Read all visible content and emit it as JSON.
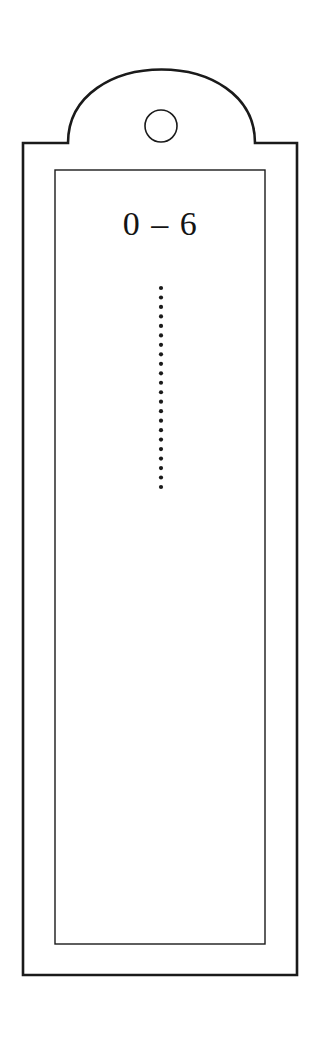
{
  "figure": {
    "name": "hang-tag-outline",
    "background_color": "#ffffff",
    "line_color": "#1a1a1a",
    "text_color": "#141414"
  },
  "tag": {
    "arch": {
      "name": "arched-top",
      "apex_y": 73,
      "left_foot_x": 68,
      "right_foot_x": 255,
      "base_y": 143
    },
    "hole": {
      "name": "hanging-hole",
      "center_x": 161,
      "center_y": 126,
      "radius": 16
    },
    "body": {
      "name": "tag-body-rectangle",
      "left": 23,
      "top": 143,
      "right": 297,
      "bottom": 975,
      "stroke_width": 2.6
    },
    "inner_frame": {
      "name": "inner-border-rectangle",
      "left": 55,
      "top": 170,
      "right": 265,
      "bottom": 944,
      "stroke_width": 1.4
    }
  },
  "content": {
    "range_label": "0 – 6",
    "dotted_line": {
      "name": "vertical-dotted-line",
      "x": 161,
      "start_y": 288,
      "end_y": 487,
      "dot_count": 22,
      "dot_radius": 2.1,
      "spacing": 9.5
    }
  }
}
